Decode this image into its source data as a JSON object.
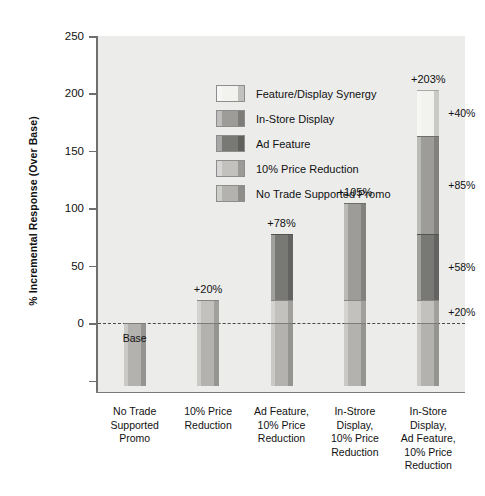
{
  "chart_data": {
    "type": "bar",
    "subtype": "stacked-bar-with-base",
    "title": "",
    "xlabel": "",
    "ylabel": "% Incremental Response (Over Base)",
    "ylim": [
      -60,
      250
    ],
    "yticks": [
      250,
      200,
      150,
      100,
      50,
      0
    ],
    "ytick_labels": [
      "250",
      "200",
      "150",
      "100",
      "50",
      "0"
    ],
    "grid": false,
    "zero_line": true,
    "zero_line_style": "dashed",
    "legend_position": "upper-left inside plot",
    "base_label": "Base",
    "base_value": -55,
    "categories": [
      "No Trade\nSupported\nPromo",
      "10% Price\nReduction",
      "Ad Feature,\n10% Price\nReduction",
      "In-Strore\nDisplay,\n10% Price\nReduction",
      "In-Store\nDisplay,\nAd Feature,\n10% Price\nReduction"
    ],
    "category_lines": [
      [
        "No Trade",
        "Supported",
        "Promo"
      ],
      [
        "10% Price",
        "Reduction"
      ],
      [
        "Ad Feature,",
        "10% Price",
        "Reduction"
      ],
      [
        "In-Strore",
        "Display,",
        "10% Price",
        "Reduction"
      ],
      [
        "In-Store",
        "Display,",
        "Ad Feature,",
        "10% Price",
        "Reduction"
      ]
    ],
    "series": [
      {
        "name": "No Trade Supported Promo",
        "color": "#b3b2ae",
        "values": [
          0,
          0,
          0,
          0,
          0
        ]
      },
      {
        "name": "10% Price Reduction",
        "color": "#c2c1bd",
        "values": [
          0,
          20,
          20,
          20,
          20
        ]
      },
      {
        "name": "Ad Feature",
        "color": "#787875",
        "values": [
          0,
          0,
          58,
          0,
          58
        ]
      },
      {
        "name": "In-Store Display",
        "color": "#9d9c98",
        "values": [
          0,
          0,
          0,
          85,
          85
        ]
      },
      {
        "name": "Feature/Display Synergy",
        "color": "#f2f2ef",
        "values": [
          0,
          0,
          0,
          0,
          40
        ]
      }
    ],
    "bar_totals": [
      0,
      20,
      78,
      105,
      203
    ],
    "bar_total_labels": [
      "",
      "+20%",
      "+78%",
      "+105%",
      "+203%"
    ],
    "segment_callouts": [
      {
        "bar": 5,
        "text": "+40%",
        "value": 40,
        "segment": "Feature/Display Synergy"
      },
      {
        "bar": 5,
        "text": "+85%",
        "value": 85,
        "segment": "In-Store Display"
      },
      {
        "bar": 5,
        "text": "+58%",
        "value": 58,
        "segment": "Ad Feature"
      },
      {
        "bar": 5,
        "text": "+20%",
        "value": 20,
        "segment": "10% Price Reduction"
      }
    ]
  },
  "legend": {
    "items": [
      {
        "label": "Feature/Display Synergy",
        "color": "#f2f2ef"
      },
      {
        "label": "In-Store Display",
        "color": "#9d9c98"
      },
      {
        "label": "Ad Feature",
        "color": "#787875"
      },
      {
        "label": "10% Price Reduction",
        "color": "#c2c1bd"
      },
      {
        "label": "No Trade Supported Promo",
        "color": "#b3b2ae"
      }
    ]
  },
  "axis": {
    "y_title": "% Incremental Response (Over Base)"
  }
}
